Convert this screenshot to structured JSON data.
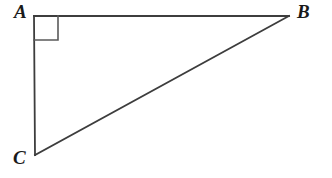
{
  "figure": {
    "name": "right-triangle-abc",
    "width": 332,
    "height": 178,
    "background_color": "#ffffff",
    "stroke_color": "#3d3d3d",
    "label_color": "#1a1a1a",
    "stroke_width": 1.8
  },
  "vertices": [
    {
      "id": "A",
      "label": "A",
      "x": 34,
      "y": 16,
      "label_x": 14,
      "label_y": 2
    },
    {
      "id": "B",
      "label": "B",
      "x": 289,
      "y": 16,
      "label_x": 297,
      "label_y": 2
    },
    {
      "id": "C",
      "label": "C",
      "x": 35,
      "y": 155,
      "label_x": 13,
      "label_y": 148
    }
  ],
  "edges": [
    {
      "id": "AB",
      "from": "A",
      "to": "B",
      "role": "leg",
      "x1": 34,
      "y1": 16,
      "x2": 289,
      "y2": 16
    },
    {
      "id": "AC",
      "from": "A",
      "to": "C",
      "role": "leg",
      "x1": 34,
      "y1": 16,
      "x2": 35,
      "y2": 155
    },
    {
      "id": "CB",
      "from": "C",
      "to": "B",
      "role": "hypotenuse",
      "x1": 35,
      "y1": 155,
      "x2": 289,
      "y2": 16
    }
  ],
  "angle_markers": [
    {
      "id": "right-angle-at-a",
      "at_vertex": "A",
      "type": "square",
      "size": 24,
      "points": "34,40 58,40 58,16"
    }
  ]
}
